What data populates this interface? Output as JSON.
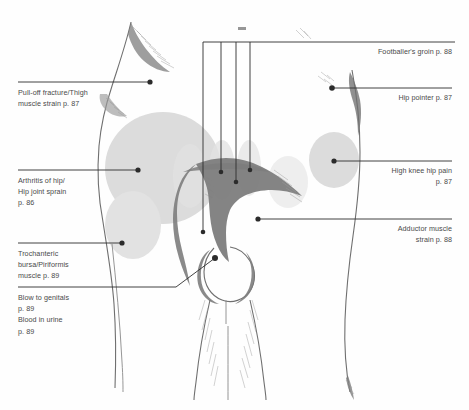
{
  "figure": {
    "background_color": "#ffffff",
    "text_color": "#4a4a4a",
    "leader_color": "#2e2e2e",
    "shade_color": "#dcdcdc",
    "muscle_color": "#7d7d7d"
  },
  "labels_left": [
    {
      "id": "pull-off-fracture",
      "text": "Pull-off fracture/Thigh\nmuscle strain p. 87",
      "page": "p. 87"
    },
    {
      "id": "arthritis-of-hip",
      "text": "Arthritis of hip/\nHip joint sprain\np. 86",
      "page": "p. 86"
    },
    {
      "id": "trochanteric-bursa",
      "text": "Trochanteric\nbursa/Piriformis\nmuscle p. 89",
      "page": "p. 89"
    },
    {
      "id": "blow-to-genitals",
      "text": "Blow to genitals\np. 89\nBlood in urine\np. 89",
      "page": "p. 89"
    }
  ],
  "labels_right": [
    {
      "id": "footballers-groin",
      "text": "Footballer's groin p. 88",
      "page": "p. 88"
    },
    {
      "id": "hip-pointer",
      "text": "Hip pointer p. 87",
      "page": "p. 87"
    },
    {
      "id": "high-knee-hip-pain",
      "text": "High knee hip pain\np. 87",
      "page": "p. 87"
    },
    {
      "id": "adductor-muscle",
      "text": "Adductor muscle\nstrain p. 88",
      "page": "p. 88"
    }
  ]
}
